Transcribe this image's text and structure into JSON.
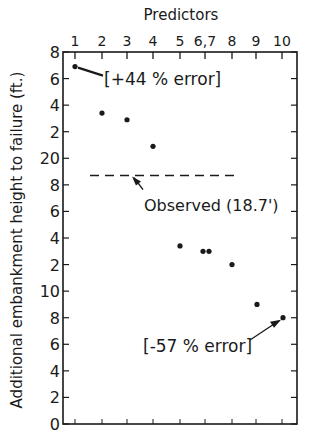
{
  "chart_data": {
    "type": "scatter",
    "title": "",
    "xlabel": "Predictors",
    "ylabel": "Additional embankment height to failure (ft.)",
    "x_axis_position": "top",
    "x_tick_labels": [
      "1",
      "2",
      "3",
      "4",
      "5",
      "6,7",
      "8",
      "9",
      "10"
    ],
    "y_tick_labels": [
      "8",
      "6",
      "4",
      "2",
      "20",
      "8",
      "6",
      "4",
      "2",
      "10",
      "8",
      "6",
      "4",
      "2",
      "0"
    ],
    "y_tick_values": [
      28,
      26,
      24,
      22,
      20,
      18,
      16,
      14,
      12,
      10,
      8,
      6,
      4,
      2,
      0
    ],
    "ylim": [
      0,
      28
    ],
    "grid": false,
    "legend": null,
    "series": [
      {
        "name": "Predicted",
        "points": [
          {
            "predictor": "1",
            "y": 26.9
          },
          {
            "predictor": "2",
            "y": 23.4
          },
          {
            "predictor": "3",
            "y": 22.9
          },
          {
            "predictor": "4",
            "y": 20.9
          },
          {
            "predictor": "5",
            "y": 13.4
          },
          {
            "predictor": "6",
            "y": 13.0
          },
          {
            "predictor": "7",
            "y": 13.0
          },
          {
            "predictor": "8",
            "y": 12.0
          },
          {
            "predictor": "9",
            "y": 9.0
          },
          {
            "predictor": "10",
            "y": 8.0
          }
        ]
      }
    ],
    "reference_lines": [
      {
        "name": "Observed",
        "y": 18.7,
        "style": "dashed",
        "label": "Observed (18.7')"
      }
    ],
    "annotations": [
      {
        "text": "[+44 % error]",
        "target_predictor": "1"
      },
      {
        "text": "[-57 % error]",
        "target_predictor": "10"
      },
      {
        "text": "Observed (18.7')",
        "target": "observed-line"
      }
    ]
  }
}
